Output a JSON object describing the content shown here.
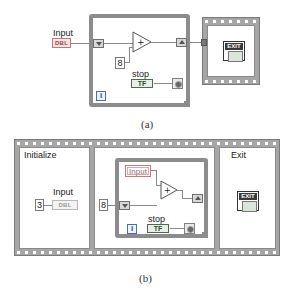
{
  "figure_a": {
    "caption": "(a)",
    "control": {
      "label": "Input",
      "type_badge": "DBL"
    },
    "while_loop": {
      "constant": "8",
      "add_symbol": "+",
      "stop_label": "stop",
      "stop_terminal": "TF",
      "iteration_terminal": "i"
    },
    "exit_frame": {
      "icon_text": "EXIT"
    }
  },
  "figure_b": {
    "caption": "(b)",
    "frames": [
      {
        "title": "Initialize",
        "constant": "3",
        "indicator_label": "Input",
        "type_badge": "DBL"
      },
      {
        "title": "",
        "constant": "8",
        "local_variable": "Input",
        "add_symbol": "+",
        "stop_label": "stop",
        "stop_terminal": "TF",
        "iteration_terminal": "i"
      },
      {
        "title": "Exit",
        "icon_text": "EXIT"
      }
    ]
  }
}
